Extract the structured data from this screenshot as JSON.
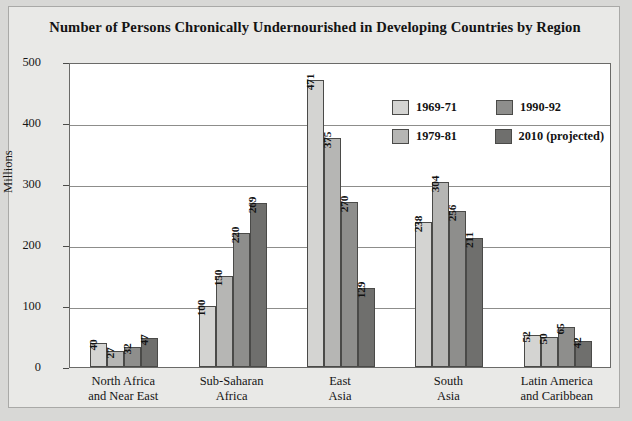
{
  "chart_data": {
    "type": "bar",
    "title": "Number of Persons Chronically Undernourished in Developing Countries by Region",
    "xlabel": "",
    "ylabel": "Millions",
    "ylim": [
      0,
      500
    ],
    "yticks": [
      0,
      100,
      200,
      300,
      400,
      500
    ],
    "grid": true,
    "legend_position": "upper right inside plot",
    "categories": [
      "North Africa\nand Near East",
      "Sub-Saharan\nAfrica",
      "East\nAsia",
      "South\nAsia",
      "Latin America\nand Caribbean"
    ],
    "series": [
      {
        "name": "1969-71",
        "color": "#d4d4d2",
        "values": [
          40,
          100,
          471,
          238,
          52
        ]
      },
      {
        "name": "1979-81",
        "color": "#b6b6b4",
        "values": [
          27,
          150,
          375,
          304,
          50
        ]
      },
      {
        "name": "1990-92",
        "color": "#8e8e8c",
        "values": [
          32,
          220,
          270,
          256,
          65
        ]
      },
      {
        "name": "2010 (projected)",
        "color": "#6f6f6d",
        "values": [
          47,
          269,
          129,
          211,
          42
        ]
      }
    ]
  },
  "axis": {
    "y_title": "Millions",
    "y_tick_labels": [
      "500",
      "400",
      "300",
      "200",
      "100",
      "0"
    ]
  },
  "categories_display": [
    {
      "line1": "North Africa",
      "line2": "and Near East"
    },
    {
      "line1": "Sub-Saharan",
      "line2": "Africa"
    },
    {
      "line1": "East",
      "line2": "Asia"
    },
    {
      "line1": "South",
      "line2": "Asia"
    },
    {
      "line1": "Latin America",
      "line2": "and Caribbean"
    }
  ],
  "legend": {
    "entries": [
      {
        "label": "1969-71"
      },
      {
        "label": "1990-92"
      },
      {
        "label": "1979-81"
      },
      {
        "label": "2010 (projected)"
      }
    ]
  },
  "source_note": ""
}
